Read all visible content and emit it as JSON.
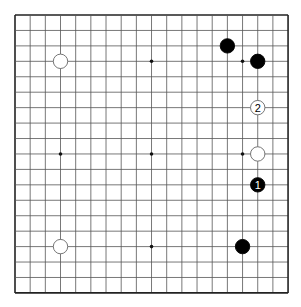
{
  "board": {
    "size": 19,
    "origin_x": 15,
    "origin_y": 15,
    "step_x": 15.17,
    "step_y": 15.44,
    "line_color": "#555555",
    "border_color": "#222222",
    "background": "#ffffff"
  },
  "star_points": [
    {
      "col": 3,
      "row": 3
    },
    {
      "col": 9,
      "row": 3
    },
    {
      "col": 15,
      "row": 3
    },
    {
      "col": 3,
      "row": 9
    },
    {
      "col": 9,
      "row": 9
    },
    {
      "col": 15,
      "row": 9
    },
    {
      "col": 3,
      "row": 15
    },
    {
      "col": 9,
      "row": 15
    },
    {
      "col": 15,
      "row": 15
    }
  ],
  "stones": [
    {
      "color": "white",
      "col": 3,
      "row": 3,
      "label": ""
    },
    {
      "color": "black",
      "col": 14,
      "row": 2,
      "label": ""
    },
    {
      "color": "black",
      "col": 16,
      "row": 3,
      "label": ""
    },
    {
      "color": "white",
      "col": 16,
      "row": 6,
      "label": "2"
    },
    {
      "color": "white",
      "col": 16,
      "row": 9,
      "label": ""
    },
    {
      "color": "black",
      "col": 16,
      "row": 11,
      "label": "1"
    },
    {
      "color": "black",
      "col": 15,
      "row": 15,
      "label": ""
    },
    {
      "color": "white",
      "col": 3,
      "row": 15,
      "label": ""
    }
  ]
}
